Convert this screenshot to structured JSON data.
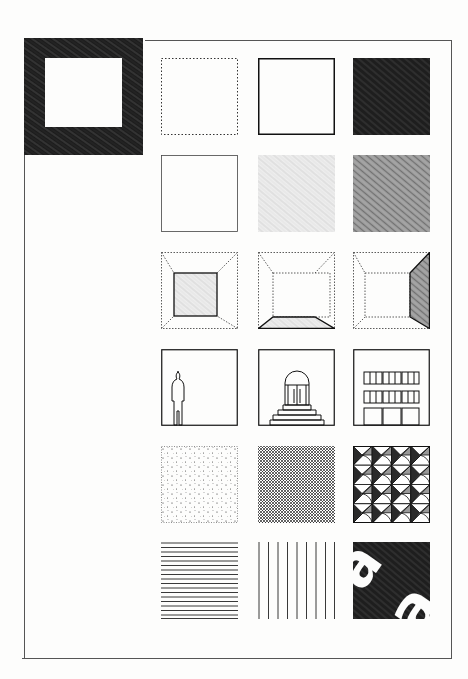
{
  "sheet": {
    "background": "#fdfdfc",
    "ink": "#1a1a1a",
    "frame": {
      "left": 24,
      "top": 40,
      "right": 451,
      "bottom": 658
    },
    "hero": {
      "name": "thick-dark-frame-square",
      "x": 24,
      "y": 38,
      "w": 119,
      "h": 117
    },
    "grid": {
      "columns_x": [
        161,
        258,
        353
      ],
      "rows_y": [
        58,
        155,
        252,
        349,
        446,
        542
      ],
      "tile_size": 77,
      "tiles": [
        [
          {
            "name": "dotted-outline-square"
          },
          {
            "name": "solid-outline-square"
          },
          {
            "name": "dark-filled-square"
          }
        ],
        [
          {
            "name": "thin-outline-square"
          },
          {
            "name": "light-texture-square"
          },
          {
            "name": "medium-texture-square"
          }
        ],
        [
          {
            "name": "perspective-room-back-wall-shaded"
          },
          {
            "name": "perspective-room-floor-shaded"
          },
          {
            "name": "perspective-room-right-wall-shaded"
          }
        ],
        [
          {
            "name": "human-figure-scale"
          },
          {
            "name": "arched-door-with-steps"
          },
          {
            "name": "building-facade-windows"
          }
        ],
        [
          {
            "name": "stipple-dot-texture"
          },
          {
            "name": "crosshatch-texture"
          },
          {
            "name": "geometric-triangle-pattern"
          }
        ],
        [
          {
            "name": "horizontal-lines-texture"
          },
          {
            "name": "vertical-lines-texture"
          },
          {
            "name": "letterform-a-on-dark"
          }
        ]
      ]
    }
  }
}
